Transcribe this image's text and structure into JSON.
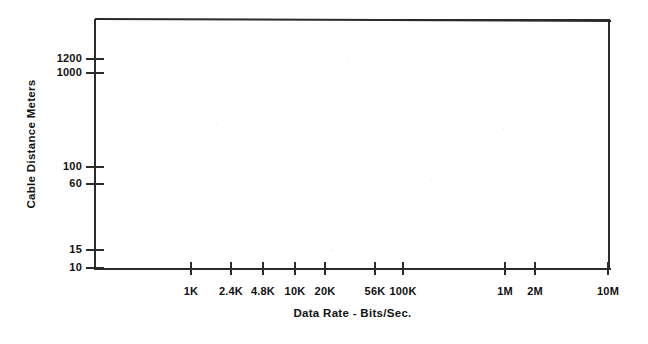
{
  "chart_data": {
    "type": "line",
    "title": "",
    "subtitle": "",
    "xlabel": "Data Rate - Bits/Sec.",
    "ylabel": "Cable Distance Meters",
    "grid": false,
    "legend": null,
    "legend_position": "none",
    "x_scale": "log",
    "y_scale": "log",
    "x_tick_labels": [
      "1K",
      "2.4K",
      "4.8K",
      "10K",
      "20K",
      "56K",
      "100K",
      "1M",
      "2M",
      "10M"
    ],
    "x_tick_values": [
      1000,
      2400,
      4800,
      10000,
      20000,
      56000,
      100000,
      1000000,
      2000000,
      10000000
    ],
    "x_tick_px": [
      191,
      231,
      263,
      295,
      325,
      375,
      403,
      505,
      535,
      608
    ],
    "y_tick_labels": [
      "1200",
      "1000",
      "100",
      "60",
      "15",
      "10"
    ],
    "y_tick_values": [
      1200,
      1000,
      100,
      60,
      15,
      10
    ],
    "y_tick_px": [
      59,
      73,
      167,
      184,
      250,
      268
    ],
    "xlim": [
      1000,
      10000000
    ],
    "ylim": [
      10,
      1200
    ],
    "series": [
      {
        "name": "",
        "values": [],
        "x": []
      }
    ],
    "annotations": [],
    "note": "Empty plot frame: axes, ticks and labels drawn, no data curve rendered inside the plot area."
  },
  "axes": {
    "frame": {
      "left_px": 95,
      "top_px": 19,
      "width_px": 515,
      "height_px": 250
    },
    "line_color": "#2b2b2b",
    "background_color": "#ffffff"
  },
  "y_axis": {
    "title": "Cable Distance Meters",
    "ticks": [
      {
        "label": "1200",
        "y": 59
      },
      {
        "label": "1000",
        "y": 73
      },
      {
        "label": "100",
        "y": 167
      },
      {
        "label": "60",
        "y": 184
      },
      {
        "label": "15",
        "y": 250
      },
      {
        "label": "10",
        "y": 268
      }
    ]
  },
  "x_axis": {
    "title": "Data Rate - Bits/Sec.",
    "ticks": [
      {
        "label": "1K",
        "x": 191
      },
      {
        "label": "2.4K",
        "x": 231
      },
      {
        "label": "4.8K",
        "x": 263
      },
      {
        "label": "10K",
        "x": 295
      },
      {
        "label": "20K",
        "x": 325
      },
      {
        "label": "56K",
        "x": 375
      },
      {
        "label": "100K",
        "x": 403
      },
      {
        "label": "1M",
        "x": 505
      },
      {
        "label": "2M",
        "x": 535
      },
      {
        "label": "10M",
        "x": 608
      }
    ]
  }
}
